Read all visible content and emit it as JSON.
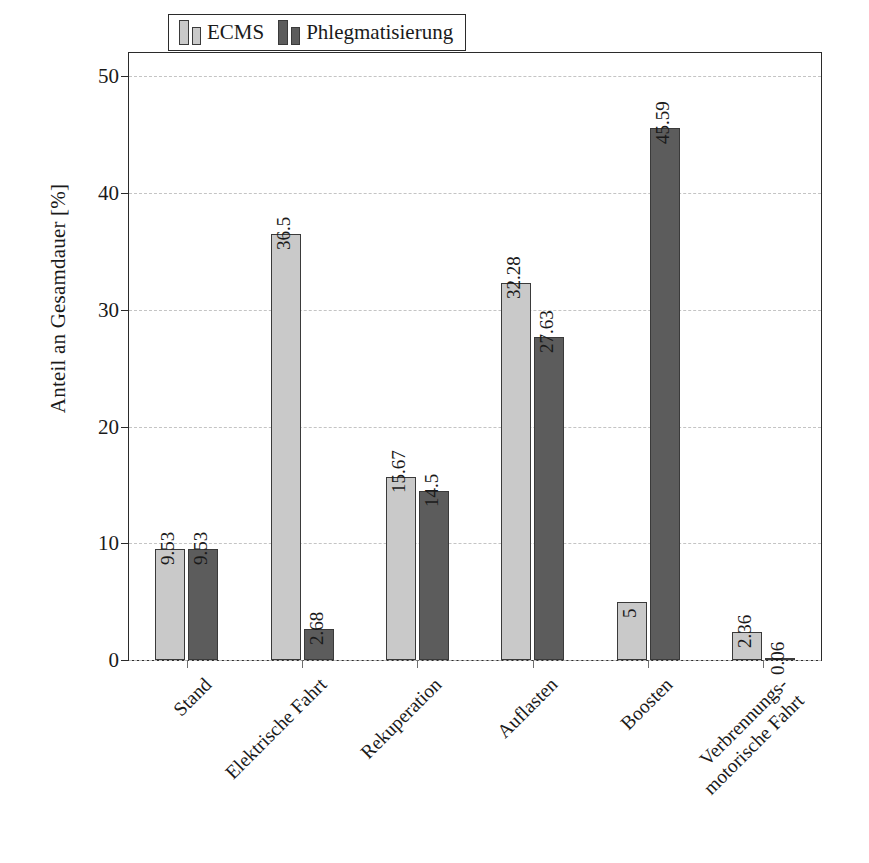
{
  "chart_data": {
    "type": "bar",
    "title": "",
    "xlabel": "",
    "ylabel": "Anteil an Gesamdauer [%]",
    "ylim": [
      0,
      52
    ],
    "yticks": [
      0,
      10,
      20,
      30,
      40,
      50
    ],
    "ytick_labels": [
      "0",
      "10",
      "20",
      "30",
      "40",
      "50"
    ],
    "grid": true,
    "legend_position": "top-center",
    "categories": [
      "Stand",
      "Elektrische Fahrt",
      "Rekuperation",
      "Auflasten",
      "Boosten",
      "Verbrennungs-\nmotorische Fahrt"
    ],
    "category_lines": [
      [
        "Stand"
      ],
      [
        "Elektrische Fahrt"
      ],
      [
        "Rekuperation"
      ],
      [
        "Auflasten"
      ],
      [
        "Boosten"
      ],
      [
        "Verbrennungs-",
        "motorische Fahrt"
      ]
    ],
    "series": [
      {
        "name": "ECMS",
        "color": "#c9c9c9",
        "values": [
          9.53,
          36.5,
          15.67,
          32.28,
          5,
          2.36
        ],
        "labels": [
          "9.53",
          "36.5",
          "15.67",
          "32.28",
          "5",
          "2.36"
        ]
      },
      {
        "name": "Phlegmatisierung",
        "color": "#5c5c5c",
        "values": [
          9.53,
          2.68,
          14.5,
          27.63,
          45.59,
          0.06
        ],
        "labels": [
          "9.53",
          "2.68",
          "14.5",
          "27.63",
          "45.59",
          "0.06"
        ]
      }
    ]
  },
  "legend": {
    "entries": [
      {
        "label": "ECMS",
        "color": "#c9c9c9"
      },
      {
        "label": "Phlegmatisierung",
        "color": "#5c5c5c"
      }
    ]
  },
  "axes": {
    "y_axis_label": "Anteil an Gesamdauer [%]"
  }
}
